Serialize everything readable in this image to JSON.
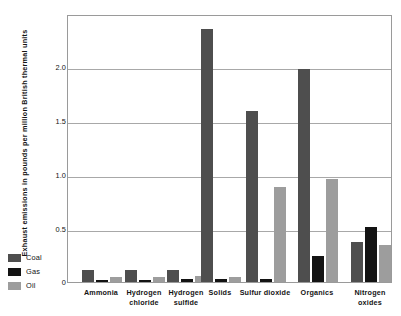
{
  "chart_data": {
    "type": "bar",
    "title": "",
    "xlabel": "",
    "ylabel": "Exhaust emissions in pounds per million British thermal units",
    "ylim": [
      0,
      2.5
    ],
    "yticks": [
      "0",
      "0.5",
      "1.0",
      "1.5",
      "2.0"
    ],
    "ytick_values": [
      0,
      0.5,
      1.0,
      1.5,
      2.0
    ],
    "grid": true,
    "legend_position": "left-bottom-outside",
    "categories": [
      "Ammonia",
      "Hydrogen chloride",
      "Hydrogen sulfide",
      "Solids",
      "Sulfur dioxide",
      "Organics",
      "Nitrogen oxides"
    ],
    "series": [
      {
        "name": "Coal",
        "color": "#4e4e4e",
        "values": [
          0.11,
          0.11,
          0.11,
          2.35,
          1.59,
          1.98,
          0.37
        ]
      },
      {
        "name": "Gas",
        "color": "#131313",
        "values": [
          0.02,
          0.02,
          0.03,
          0.03,
          0.03,
          0.24,
          0.51
        ]
      },
      {
        "name": "Oil",
        "color": "#9d9d9d",
        "values": [
          0.05,
          0.05,
          0.06,
          0.05,
          0.88,
          0.96,
          0.34
        ]
      }
    ],
    "annotations": [
      {
        "text": "1.7",
        "category": "Solids",
        "series": "Coal",
        "note": "value label above broken bar"
      }
    ]
  },
  "axis": {
    "y_title": "Exhaust emissions in pounds per million British thermal units",
    "y_tick_labels": [
      "2.0",
      "1.5",
      "1.0",
      "0.5",
      "0"
    ]
  },
  "xlabels": [
    {
      "line1": "Ammonia",
      "line2": ""
    },
    {
      "line1": "Hydrogen",
      "line2": "chloride"
    },
    {
      "line1": "Hydrogen",
      "line2": "sulfide"
    },
    {
      "line1": "Solids",
      "line2": ""
    },
    {
      "line1": "Sulfur dioxide",
      "line2": ""
    },
    {
      "line1": "Organics",
      "line2": ""
    },
    {
      "line1": "Nitrogen",
      "line2": "oxides"
    }
  ],
  "legend": {
    "items": [
      {
        "label": "Coal",
        "color": "#4e4e4e"
      },
      {
        "label": "Gas",
        "color": "#131313"
      },
      {
        "label": "Oil",
        "color": "#9d9d9d"
      }
    ]
  },
  "annotation": {
    "solids_coal_value": "1.7"
  }
}
